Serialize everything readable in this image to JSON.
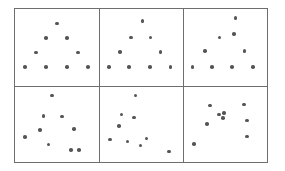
{
  "figure": {
    "title": "",
    "panel_count": 6,
    "points_per_panel": 10,
    "frame_color": "#6e6e6e",
    "dot_color": "#555555",
    "background_color": "#ffffff"
  },
  "chart_data": {
    "type": "scatter",
    "title": "",
    "xlabel": "",
    "ylabel": "",
    "grid": false,
    "legend": null,
    "axis_ticks": false,
    "xlim": [
      0,
      100
    ],
    "ylim": [
      0,
      100
    ],
    "layout": {
      "rows": 2,
      "cols": 3,
      "shared_axes": true,
      "panel_order": "row-major"
    },
    "marker": {
      "shape": "circle",
      "color": "#555555",
      "size_px": 3.6
    },
    "panels": [
      {
        "index": 1,
        "row": 0,
        "col": 0,
        "label": "",
        "n": 10,
        "points": [
          {
            "x": 50.0,
            "y": 81.0
          },
          {
            "x": 37.0,
            "y": 62.0
          },
          {
            "x": 62.0,
            "y": 62.0
          },
          {
            "x": 25.0,
            "y": 43.0
          },
          {
            "x": 75.0,
            "y": 43.0
          },
          {
            "x": 12.0,
            "y": 24.0
          },
          {
            "x": 37.0,
            "y": 24.0
          },
          {
            "x": 62.0,
            "y": 24.0
          },
          {
            "x": 87.0,
            "y": 24.0
          },
          {
            "x": 50.0,
            "y": 81.0
          }
        ]
      },
      {
        "index": 2,
        "row": 0,
        "col": 1,
        "label": "",
        "n": 10,
        "points": [
          {
            "x": 51.0,
            "y": 84.0
          },
          {
            "x": 37.0,
            "y": 63.0
          },
          {
            "x": 61.0,
            "y": 63.0
          },
          {
            "x": 24.0,
            "y": 44.0
          },
          {
            "x": 73.0,
            "y": 44.0
          },
          {
            "x": 11.0,
            "y": 24.0
          },
          {
            "x": 35.0,
            "y": 24.0
          },
          {
            "x": 60.0,
            "y": 24.0
          },
          {
            "x": 85.0,
            "y": 24.0
          },
          {
            "x": 51.0,
            "y": 84.0
          }
        ]
      },
      {
        "index": 3,
        "row": 0,
        "col": 2,
        "label": "",
        "n": 10,
        "points": [
          {
            "x": 62.0,
            "y": 88.0
          },
          {
            "x": 43.0,
            "y": 63.0
          },
          {
            "x": 60.0,
            "y": 67.0
          },
          {
            "x": 25.0,
            "y": 45.0
          },
          {
            "x": 73.0,
            "y": 45.0
          },
          {
            "x": 10.0,
            "y": 24.0
          },
          {
            "x": 34.0,
            "y": 24.0
          },
          {
            "x": 58.0,
            "y": 24.0
          },
          {
            "x": 83.0,
            "y": 24.0
          },
          {
            "x": 62.0,
            "y": 88.0
          }
        ]
      },
      {
        "index": 4,
        "row": 1,
        "col": 0,
        "label": "",
        "n": 10,
        "points": [
          {
            "x": 44.0,
            "y": 88.0
          },
          {
            "x": 34.0,
            "y": 61.0
          },
          {
            "x": 56.0,
            "y": 60.0
          },
          {
            "x": 30.0,
            "y": 42.0
          },
          {
            "x": 70.0,
            "y": 44.0
          },
          {
            "x": 12.0,
            "y": 33.0
          },
          {
            "x": 40.0,
            "y": 23.0
          },
          {
            "x": 67.0,
            "y": 16.0
          },
          {
            "x": 76.0,
            "y": 16.0
          },
          {
            "x": 44.0,
            "y": 88.0
          }
        ]
      },
      {
        "index": 5,
        "row": 1,
        "col": 1,
        "label": "",
        "n": 10,
        "points": [
          {
            "x": 43.0,
            "y": 88.0
          },
          {
            "x": 26.0,
            "y": 63.0
          },
          {
            "x": 41.0,
            "y": 59.0
          },
          {
            "x": 23.0,
            "y": 48.0
          },
          {
            "x": 12.0,
            "y": 30.0
          },
          {
            "x": 33.0,
            "y": 27.0
          },
          {
            "x": 56.0,
            "y": 31.0
          },
          {
            "x": 49.0,
            "y": 22.0
          },
          {
            "x": 83.0,
            "y": 14.0
          },
          {
            "x": 43.0,
            "y": 88.0
          }
        ]
      },
      {
        "index": 6,
        "row": 1,
        "col": 2,
        "label": "",
        "n": 10,
        "points": [
          {
            "x": 31.0,
            "y": 75.0
          },
          {
            "x": 72.0,
            "y": 76.0
          },
          {
            "x": 42.0,
            "y": 63.0
          },
          {
            "x": 48.0,
            "y": 65.0
          },
          {
            "x": 47.0,
            "y": 58.0
          },
          {
            "x": 76.0,
            "y": 55.0
          },
          {
            "x": 28.0,
            "y": 50.0
          },
          {
            "x": 76.0,
            "y": 34.0
          },
          {
            "x": 12.0,
            "y": 24.0
          },
          {
            "x": 31.0,
            "y": 75.0
          }
        ]
      }
    ]
  }
}
